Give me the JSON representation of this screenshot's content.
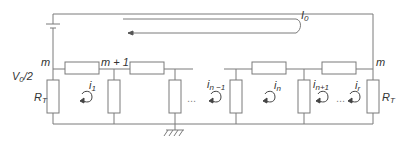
{
  "diagram": {
    "type": "circuit-ladder-network",
    "colors": {
      "wire": "#7a7a7a",
      "text": "#333333",
      "background": "#ffffff"
    },
    "labels": {
      "source_current": {
        "main": "I",
        "sub": "0"
      },
      "node_left": "m",
      "node_next": "m + 1",
      "node_right": "m",
      "voltage": {
        "main": "V",
        "sub": "0",
        "suffix": "/2"
      },
      "termination_left": {
        "main": "R",
        "sub": "T"
      },
      "termination_right": {
        "main": "R",
        "sub": "T"
      },
      "loop_currents": [
        {
          "main": "i",
          "sub": "1"
        },
        {
          "main": "i",
          "sub": "n −1"
        },
        {
          "main": "i",
          "sub": "n"
        },
        {
          "main": "i",
          "sub": "n+1"
        },
        {
          "main": "i",
          "sub": "r"
        }
      ],
      "ellipsis": "..."
    },
    "components": {
      "battery": 1,
      "series_resistors": 4,
      "shunt_resistors": 4,
      "termination_resistors": 2,
      "ground": 1
    }
  }
}
